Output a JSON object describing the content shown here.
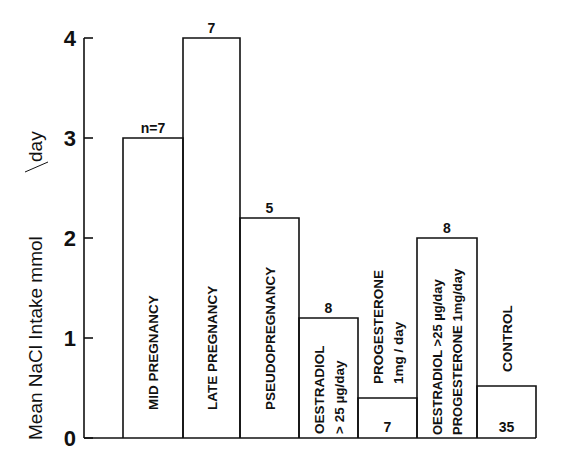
{
  "chart_data": {
    "type": "bar",
    "title": "",
    "xlabel": "",
    "ylabel": "Mean NaCl Intake mmol/day",
    "ylim": [
      0,
      4
    ],
    "yticks": [
      0,
      1,
      2,
      3,
      4
    ],
    "grid": false,
    "legend": null,
    "categories": [
      "MID PREGNANCY",
      "LATE PREGNANCY",
      "PSEUDOPREGNANCY",
      "OESTRADIOL >25 µg/day",
      "PROGESTERONE 1mg/day",
      "OESTRADIOL >25 µg/day + PROGESTERONE 1mg/day",
      "CONTROL"
    ],
    "values": [
      3.0,
      4.0,
      2.2,
      1.2,
      0.4,
      2.0,
      0.52
    ],
    "n_labels": [
      "n=7",
      "7",
      "5",
      "8",
      "7",
      "8",
      "35"
    ],
    "bars": [
      {
        "label_lines": [
          "MID  PREGNANCY"
        ],
        "value": 3.0,
        "n": "n=7",
        "n_position": "above"
      },
      {
        "label_lines": [
          "LATE  PREGNANCY"
        ],
        "value": 4.0,
        "n": "7",
        "n_position": "above"
      },
      {
        "label_lines": [
          "PSEUDOPREGNANCY"
        ],
        "value": 2.2,
        "n": "5",
        "n_position": "above"
      },
      {
        "label_lines": [
          "OESTRADIOL",
          "> 25 µg/day"
        ],
        "value": 1.2,
        "n": "8",
        "n_position": "above"
      },
      {
        "label_lines": [
          "PROGESTERONE",
          "1mg / day"
        ],
        "value": 0.4,
        "n": "7",
        "n_position": "inside"
      },
      {
        "label_lines": [
          "OESTRADIOL  >25 µg/day",
          "PROGESTERONE 1mg/day"
        ],
        "value": 2.0,
        "n": "8",
        "n_position": "above"
      },
      {
        "label_lines": [
          "CONTROL"
        ],
        "value": 0.52,
        "n": "35",
        "n_position": "inside"
      }
    ]
  },
  "axis": {
    "ylabel_main": "Mean  NaCl  Intake  mmol",
    "ylabel_unit": "day",
    "ticks": [
      "0",
      "1",
      "2",
      "3",
      "4"
    ]
  }
}
